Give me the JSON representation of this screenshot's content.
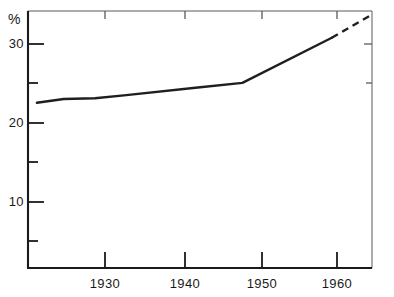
{
  "chart_data": {
    "type": "line",
    "title": "",
    "subtitle": "",
    "xlabel": "",
    "ylabel": "%",
    "unit_label": "%",
    "xlim": [
      1926.0,
      1964.5
    ],
    "ylim": [
      1.4,
      35.0
    ],
    "grid": false,
    "legend": false,
    "y_axis": {
      "major_ticks": [
        30,
        20,
        10
      ],
      "major_tick_labels": [
        "30",
        "20",
        "10"
      ],
      "minor_ticks": [
        25,
        15,
        5
      ]
    },
    "x_axis": {
      "major_ticks": [
        1930,
        1940,
        1950,
        1960
      ],
      "major_tick_labels": [
        "1930",
        "1940",
        "1950",
        "1960"
      ]
    },
    "series": [
      {
        "name": "observed",
        "style": "solid",
        "x": [
          1927.0,
          1930.0,
          1933.5,
          1937.0,
          1945.0,
          1950.0,
          1960.0
        ],
        "values": [
          23.0,
          23.5,
          23.6,
          24.0,
          25.0,
          25.6,
          31.5
        ]
      },
      {
        "name": "projected",
        "style": "dashed",
        "x": [
          1960.0,
          1964.3
        ],
        "values": [
          31.5,
          34.4
        ]
      }
    ],
    "annotations": []
  },
  "colors": {
    "axis": "#1a1a1a",
    "line": "#1f1f1f",
    "background": "#ffffff",
    "text": "#1a1a1a"
  },
  "labels": {
    "y": [
      "30",
      "20",
      "10"
    ],
    "x": [
      "1930",
      "1940",
      "1950",
      "1960"
    ],
    "unit": "%"
  }
}
